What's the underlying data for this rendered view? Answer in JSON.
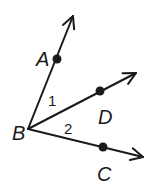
{
  "diagram": {
    "type": "angle-rays",
    "vertex": {
      "label": "B",
      "x": 28,
      "y": 129,
      "label_x": 12,
      "label_y": 140
    },
    "rays": [
      {
        "name": "BA",
        "point_label": "A",
        "point": {
          "x": 57,
          "y": 59
        },
        "tip": {
          "x": 73,
          "y": 16
        },
        "label_x": 36,
        "label_y": 66
      },
      {
        "name": "BD",
        "point_label": "D",
        "point": {
          "x": 100,
          "y": 91
        },
        "tip": {
          "x": 136,
          "y": 73
        },
        "label_x": 98,
        "label_y": 124
      },
      {
        "name": "BC",
        "point_label": "C",
        "point": {
          "x": 103,
          "y": 147
        },
        "tip": {
          "x": 143,
          "y": 157
        },
        "label_x": 97,
        "label_y": 181
      }
    ],
    "angles": [
      {
        "label": "1",
        "between": [
          "BA",
          "BD"
        ],
        "x": 48,
        "y": 106
      },
      {
        "label": "2",
        "between": [
          "BD",
          "BC"
        ],
        "x": 64,
        "y": 134
      }
    ],
    "stroke_color": "#1a1a1a"
  }
}
